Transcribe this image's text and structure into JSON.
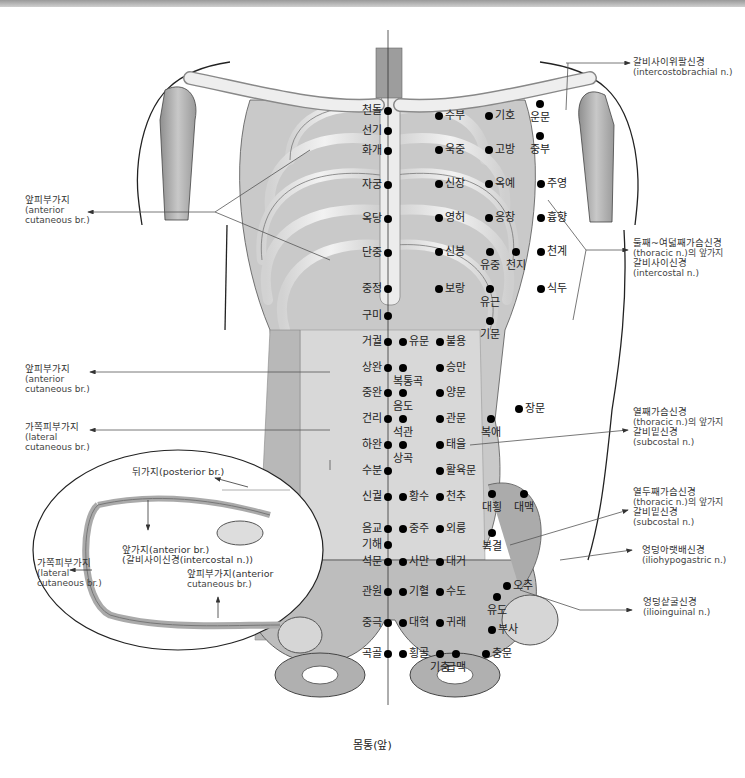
{
  "caption": "몸통(앞)",
  "colors": {
    "bone": "#e6e6e6",
    "muscle": "#b9b9b9",
    "outline": "#222222",
    "point": "#000000",
    "leader": "#555555"
  },
  "points": [
    {
      "label": "천돌",
      "x": 388,
      "y": 111,
      "side": "left"
    },
    {
      "label": "선기",
      "x": 388,
      "y": 131,
      "side": "left"
    },
    {
      "label": "화개",
      "x": 388,
      "y": 151,
      "side": "left"
    },
    {
      "label": "자궁",
      "x": 388,
      "y": 185,
      "side": "left"
    },
    {
      "label": "옥당",
      "x": 388,
      "y": 219,
      "side": "left"
    },
    {
      "label": "단중",
      "x": 388,
      "y": 253,
      "side": "left"
    },
    {
      "label": "중정",
      "x": 388,
      "y": 289,
      "side": "left"
    },
    {
      "label": "구미",
      "x": 388,
      "y": 316,
      "side": "left"
    },
    {
      "label": "거궐",
      "x": 388,
      "y": 342,
      "side": "left"
    },
    {
      "label": "상완",
      "x": 388,
      "y": 368,
      "side": "left"
    },
    {
      "label": "중완",
      "x": 388,
      "y": 393,
      "side": "left"
    },
    {
      "label": "건리",
      "x": 388,
      "y": 419,
      "side": "left"
    },
    {
      "label": "하완",
      "x": 388,
      "y": 445,
      "side": "left"
    },
    {
      "label": "수분",
      "x": 388,
      "y": 471,
      "side": "left"
    },
    {
      "label": "신궐",
      "x": 388,
      "y": 497,
      "side": "left"
    },
    {
      "label": "음교",
      "x": 388,
      "y": 529,
      "side": "left"
    },
    {
      "label": "기해",
      "x": 388,
      "y": 545,
      "side": "left"
    },
    {
      "label": "석문",
      "x": 388,
      "y": 562,
      "side": "left"
    },
    {
      "label": "관원",
      "x": 388,
      "y": 592,
      "side": "left"
    },
    {
      "label": "중극",
      "x": 388,
      "y": 623,
      "side": "left"
    },
    {
      "label": "곡골",
      "x": 388,
      "y": 654,
      "side": "left"
    },
    {
      "label": "유문",
      "x": 403,
      "y": 342,
      "side": "right"
    },
    {
      "label": "복통곡",
      "x": 403,
      "y": 368,
      "side": "below"
    },
    {
      "label": "음도",
      "x": 403,
      "y": 393,
      "side": "below"
    },
    {
      "label": "석관",
      "x": 403,
      "y": 419,
      "side": "below"
    },
    {
      "label": "상곡",
      "x": 403,
      "y": 445,
      "side": "below"
    },
    {
      "label": "황수",
      "x": 403,
      "y": 497,
      "side": "right"
    },
    {
      "label": "중주",
      "x": 403,
      "y": 529,
      "side": "right"
    },
    {
      "label": "사만",
      "x": 403,
      "y": 562,
      "side": "right"
    },
    {
      "label": "기혈",
      "x": 403,
      "y": 592,
      "side": "right"
    },
    {
      "label": "대혁",
      "x": 403,
      "y": 623,
      "side": "right"
    },
    {
      "label": "횡골",
      "x": 403,
      "y": 654,
      "side": "right"
    },
    {
      "label": "수부",
      "x": 439,
      "y": 116,
      "side": "right"
    },
    {
      "label": "욱중",
      "x": 439,
      "y": 150,
      "side": "right"
    },
    {
      "label": "신장",
      "x": 439,
      "y": 184,
      "side": "right"
    },
    {
      "label": "영허",
      "x": 439,
      "y": 218,
      "side": "right"
    },
    {
      "label": "신봉",
      "x": 439,
      "y": 252,
      "side": "right"
    },
    {
      "label": "보랑",
      "x": 439,
      "y": 289,
      "side": "right"
    },
    {
      "label": "불용",
      "x": 440,
      "y": 342,
      "side": "right"
    },
    {
      "label": "승만",
      "x": 440,
      "y": 368,
      "side": "right"
    },
    {
      "label": "양문",
      "x": 440,
      "y": 393,
      "side": "right"
    },
    {
      "label": "관문",
      "x": 440,
      "y": 419,
      "side": "right"
    },
    {
      "label": "태을",
      "x": 440,
      "y": 445,
      "side": "right"
    },
    {
      "label": "활육문",
      "x": 440,
      "y": 471,
      "side": "right"
    },
    {
      "label": "천추",
      "x": 440,
      "y": 497,
      "side": "right"
    },
    {
      "label": "외릉",
      "x": 440,
      "y": 529,
      "side": "right"
    },
    {
      "label": "대거",
      "x": 440,
      "y": 562,
      "side": "right"
    },
    {
      "label": "수도",
      "x": 440,
      "y": 592,
      "side": "right"
    },
    {
      "label": "귀래",
      "x": 440,
      "y": 623,
      "side": "right"
    },
    {
      "label": "기충",
      "x": 440,
      "y": 654,
      "side": "below"
    },
    {
      "label": "급맥",
      "x": 456,
      "y": 654,
      "side": "below"
    },
    {
      "label": "기호",
      "x": 489,
      "y": 116,
      "side": "right"
    },
    {
      "label": "고방",
      "x": 489,
      "y": 150,
      "side": "right"
    },
    {
      "label": "옥예",
      "x": 489,
      "y": 184,
      "side": "right"
    },
    {
      "label": "응창",
      "x": 489,
      "y": 218,
      "side": "right"
    },
    {
      "label": "유중",
      "x": 490,
      "y": 252,
      "side": "below"
    },
    {
      "label": "천지",
      "x": 516,
      "y": 252,
      "side": "below"
    },
    {
      "label": "유근",
      "x": 490,
      "y": 289,
      "side": "below"
    },
    {
      "label": "기문",
      "x": 490,
      "y": 321,
      "side": "below"
    },
    {
      "label": "복애",
      "x": 491,
      "y": 419,
      "side": "below"
    },
    {
      "label": "장문",
      "x": 519,
      "y": 409,
      "side": "right"
    },
    {
      "label": "대횡",
      "x": 492,
      "y": 494,
      "side": "below"
    },
    {
      "label": "대맥",
      "x": 524,
      "y": 494,
      "side": "below"
    },
    {
      "label": "복결",
      "x": 492,
      "y": 533,
      "side": "below"
    },
    {
      "label": "오추",
      "x": 507,
      "y": 586,
      "side": "right"
    },
    {
      "label": "유도",
      "x": 497,
      "y": 597,
      "side": "below"
    },
    {
      "label": "부사",
      "x": 492,
      "y": 630,
      "side": "right"
    },
    {
      "label": "충문",
      "x": 486,
      "y": 654,
      "side": "right"
    },
    {
      "label": "운문",
      "x": 540,
      "y": 104,
      "side": "below"
    },
    {
      "label": "중부",
      "x": 540,
      "y": 136,
      "side": "below"
    },
    {
      "label": "주영",
      "x": 541,
      "y": 184,
      "side": "right"
    },
    {
      "label": "흉향",
      "x": 541,
      "y": 218,
      "side": "right"
    },
    {
      "label": "천계",
      "x": 541,
      "y": 252,
      "side": "right"
    },
    {
      "label": "식두",
      "x": 541,
      "y": 289,
      "side": "right"
    }
  ],
  "annotations": {
    "intercostobrachial": {
      "ko": "갈비사이위팔신경",
      "en": "(intercostobrachial n.)"
    },
    "thoracic_2_8": {
      "ko": "둘째~여덟째가슴신경",
      "en": "(thoracic n.)의 앞가지",
      "ko2": "갈비사이신경",
      "en2": "(intercostal n.)"
    },
    "thoracic_11": {
      "ko": "열째가슴신경",
      "en": "(thoracic n.)의 앞가지",
      "ko2": "갈비밑신경",
      "en2": "(subcostal n.)"
    },
    "thoracic_12": {
      "ko": "열두째가슴신경",
      "en": "(thoracic n.)의 앞가지",
      "ko2": "갈비밑신경",
      "en2": "(subcostal n.)"
    },
    "iliohypogastric": {
      "ko": "엉덩아랫배신경",
      "en": "(iliohypogastric n.)"
    },
    "ilioinguinal": {
      "ko": "엉덩샅굴신경",
      "en": "(ilioinguinal n.)"
    },
    "anterior_cutaneous_upper": {
      "ko": "앞피부가지",
      "en": "(anterior",
      "en2": "cutaneous br.)"
    },
    "anterior_cutaneous_mid": {
      "ko": "앞피부가지",
      "en": "(anterior",
      "en2": "cutaneous br.)"
    },
    "lateral_cutaneous": {
      "ko": "가쪽피부가지",
      "en": "(lateral",
      "en2": "cutaneous br.)"
    }
  },
  "inset": {
    "posterior": "뒤가지(posterior br.)",
    "anterior_br": "앞가지(anterior br.)",
    "intercostal": "(갈비사이신경(intercostal n.))",
    "lateral_ko": "가쪽피부가지",
    "lateral_en": "(lateral",
    "lateral_en2": "cutaneous br.)",
    "anterior_cut": "앞피부가지(anterior",
    "anterior_cut2": "cutaneous br.)"
  }
}
